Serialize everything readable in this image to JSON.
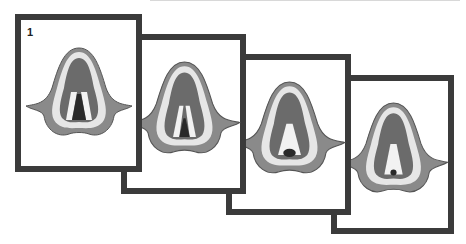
{
  "diagram": {
    "type": "sequence-of-panels",
    "panels": [
      {
        "label": "1",
        "glottis_state": "wide open"
      },
      {
        "label": "2",
        "glottis_state": "partially closing"
      },
      {
        "label": "3",
        "glottis_state": "mostly closed"
      },
      {
        "label": "4",
        "glottis_state": "nearly closed"
      }
    ]
  },
  "colors": {
    "frame_border": "#3b3b3b",
    "tissue_dark": "#6b6b6b",
    "tissue_light": "#e6e6e6",
    "glottis": "#2a2a2a"
  }
}
